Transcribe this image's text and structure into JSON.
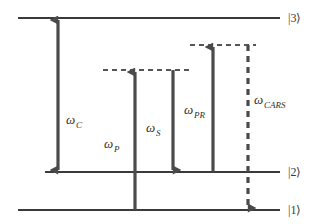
{
  "figure": {
    "kind": "energy-level-diagram",
    "title": "",
    "background_color": "#ffffff",
    "line_color": "#3a3a3a",
    "arrow_color": "#4a4a4a",
    "dashed_color": "#555555"
  },
  "states": [
    {
      "id": "state-3",
      "label": "|3⟩",
      "y": 18,
      "x_start": 18,
      "x_end": 280,
      "style": "solid"
    },
    {
      "id": "state-2",
      "label": "|2⟩",
      "y": 172,
      "x_start": 45,
      "x_end": 280,
      "style": "solid"
    },
    {
      "id": "state-1",
      "label": "|1⟩",
      "y": 210,
      "x_start": 18,
      "x_end": 280,
      "style": "solid"
    }
  ],
  "virtual_levels": [
    {
      "id": "virtual-level-left",
      "y": 70,
      "x_start": 103,
      "x_end": 190,
      "style": "dashed"
    },
    {
      "id": "virtual-level-right",
      "y": 45,
      "x_start": 190,
      "x_end": 256,
      "style": "dashed"
    }
  ],
  "transitions": [
    {
      "id": "omega-c",
      "symbol": "ω",
      "subscript": "C",
      "label": "ωC",
      "x": 58,
      "y_top": 18,
      "y_bottom": 172,
      "direction": "both",
      "style": "solid",
      "label_x": 66,
      "label_y": 124,
      "from_state": "|2⟩",
      "to_state": "|3⟩"
    },
    {
      "id": "omega-p",
      "symbol": "ω",
      "subscript": "P",
      "label": "ωP",
      "x": 135,
      "y_top": 70,
      "y_bottom": 210,
      "direction": "up",
      "style": "solid",
      "label_x": 104,
      "label_y": 148,
      "from_state": "|1⟩",
      "to_state": "virtual-level-left"
    },
    {
      "id": "omega-s",
      "symbol": "ω",
      "subscript": "S",
      "label": "ωS",
      "x": 173,
      "y_top": 70,
      "y_bottom": 172,
      "direction": "down",
      "style": "solid",
      "label_x": 146,
      "label_y": 132,
      "from_state": "virtual-level-left",
      "to_state": "|2⟩"
    },
    {
      "id": "omega-pr",
      "symbol": "ω",
      "subscript": "PR",
      "label": "ωPR",
      "x": 213,
      "y_top": 45,
      "y_bottom": 172,
      "direction": "up",
      "style": "solid",
      "label_x": 186,
      "label_y": 114,
      "from_state": "|2⟩",
      "to_state": "virtual-level-right"
    },
    {
      "id": "omega-cars",
      "symbol": "ω",
      "subscript": "CARS",
      "label": "ωCARS",
      "x": 248,
      "y_top": 45,
      "y_bottom": 210,
      "direction": "down",
      "style": "dashed",
      "label_x": 254,
      "label_y": 104,
      "from_state": "virtual-level-right",
      "to_state": "|1⟩"
    }
  ],
  "state_label_x": 288
}
